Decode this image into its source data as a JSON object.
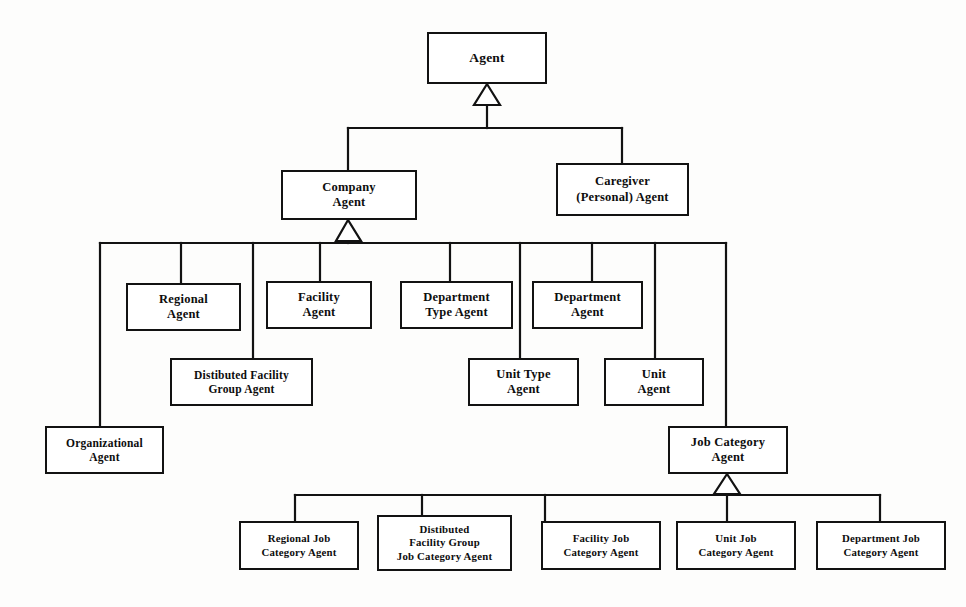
{
  "diagram": {
    "type": "uml-class-generalization",
    "stroke_color": "#121212",
    "fill_color": "#ffffff",
    "background_color": "#fdfdfc",
    "nodes": [
      {
        "id": "agent",
        "label": "Agent",
        "x": 427,
        "y": 32,
        "w": 120,
        "h": 52,
        "font": "f13"
      },
      {
        "id": "company-agent",
        "label": "Company\nAgent",
        "x": 281,
        "y": 170,
        "w": 136,
        "h": 50,
        "font": "f12"
      },
      {
        "id": "caregiver-personal-agent",
        "label": "Caregiver\n(Personal) Agent",
        "x": 556,
        "y": 163,
        "w": 133,
        "h": 53,
        "font": "f12"
      },
      {
        "id": "regional-agent",
        "label": "Regional\nAgent",
        "x": 126,
        "y": 283,
        "w": 115,
        "h": 48,
        "font": "f12"
      },
      {
        "id": "facility-agent",
        "label": "Facility\nAgent",
        "x": 266,
        "y": 281,
        "w": 106,
        "h": 48,
        "font": "f12"
      },
      {
        "id": "department-type-agent",
        "label": "Department\nType Agent",
        "x": 400,
        "y": 281,
        "w": 113,
        "h": 48,
        "font": "f12"
      },
      {
        "id": "department-agent",
        "label": "Department\nAgent",
        "x": 532,
        "y": 281,
        "w": 111,
        "h": 48,
        "font": "f12"
      },
      {
        "id": "distibuted-facility-group-agent",
        "label": "Distibuted Facility\nGroup Agent",
        "x": 170,
        "y": 358,
        "w": 143,
        "h": 48,
        "font": "f11"
      },
      {
        "id": "unit-type-agent",
        "label": "Unit Type\nAgent",
        "x": 468,
        "y": 358,
        "w": 111,
        "h": 48,
        "font": "f12"
      },
      {
        "id": "unit-agent",
        "label": "Unit\nAgent",
        "x": 604,
        "y": 358,
        "w": 100,
        "h": 48,
        "font": "f12"
      },
      {
        "id": "organizational-agent",
        "label": "Organizational\nAgent",
        "x": 45,
        "y": 426,
        "w": 119,
        "h": 48,
        "font": "f11"
      },
      {
        "id": "job-category-agent",
        "label": "Job Category\nAgent",
        "x": 668,
        "y": 426,
        "w": 120,
        "h": 48,
        "font": "f12"
      },
      {
        "id": "regional-job-category-agent",
        "label": "Regional Job\nCategory Agent",
        "x": 239,
        "y": 521,
        "w": 120,
        "h": 49,
        "font": "f105"
      },
      {
        "id": "distibuted-facility-group-job-category-agent",
        "label": "Distibuted\nFacility Group\nJob Category Agent",
        "x": 377,
        "y": 515,
        "w": 135,
        "h": 56,
        "font": "f105"
      },
      {
        "id": "facility-job-category-agent",
        "label": "Facility Job\nCategory Agent",
        "x": 541,
        "y": 521,
        "w": 120,
        "h": 49,
        "font": "f105"
      },
      {
        "id": "unit-job-category-agent",
        "label": "Unit Job\nCategory Agent",
        "x": 676,
        "y": 521,
        "w": 120,
        "h": 49,
        "font": "f105"
      },
      {
        "id": "department-job-category-agent",
        "label": "Department Job\nCategory Agent",
        "x": 816,
        "y": 521,
        "w": 130,
        "h": 49,
        "font": "f105"
      }
    ],
    "generalizations": [
      {
        "id": "gen-agent",
        "parent": "agent",
        "triangle_x": 487,
        "triangle_top_y": 84,
        "bus_y": 128,
        "children_x": [
          348,
          622
        ]
      },
      {
        "id": "gen-company",
        "parent": "company-agent",
        "triangle_x": 348,
        "triangle_top_y": 220,
        "bus_y": 243,
        "children_x": [
          100,
          181,
          253,
          320,
          450,
          520,
          592,
          726
        ]
      },
      {
        "id": "gen-job-category",
        "parent": "job-category-agent",
        "triangle_x": 727,
        "triangle_top_y": 474,
        "bus_y": 495,
        "children_x": [
          295,
          422,
          545,
          727,
          880
        ]
      }
    ],
    "connector_notes": {
      "agent_children": [
        "company-agent",
        "caregiver-personal-agent"
      ],
      "company_children": [
        "organizational-agent",
        "regional-agent",
        "distibuted-facility-group-agent",
        "facility-agent",
        "department-type-agent",
        "unit-type-agent",
        "department-agent",
        "unit-agent",
        "job-category-agent"
      ],
      "job_category_children": [
        "regional-job-category-agent",
        "distibuted-facility-group-job-category-agent",
        "facility-job-category-agent",
        "unit-job-category-agent",
        "department-job-category-agent"
      ]
    }
  }
}
